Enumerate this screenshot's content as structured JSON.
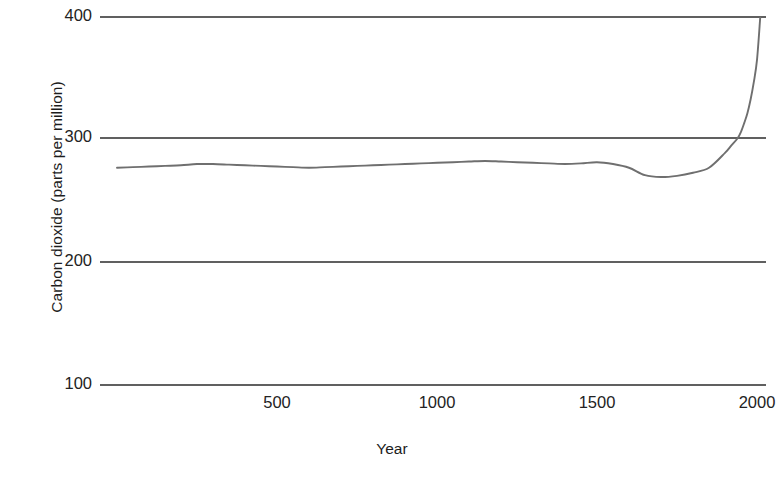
{
  "chart_data": {
    "type": "line",
    "title": "",
    "subtitle": "",
    "xlabel": "Year",
    "ylabel": "Carbon dioxide (parts per million)",
    "xlim": [
      0,
      2010
    ],
    "ylim": [
      100,
      400
    ],
    "xticks": [
      500,
      1000,
      1500,
      2000
    ],
    "xtick_labels": [
      "500",
      "1000",
      "1500",
      "2000"
    ],
    "yticks": [
      100,
      200,
      300,
      400
    ],
    "ytick_labels": [
      "100",
      "200",
      "300",
      "400"
    ],
    "grid": "horizontal",
    "legend": "none",
    "line_color": "#6f6f6f",
    "grid_color": "#2b2b2b",
    "series": [
      {
        "name": "Atmospheric CO2",
        "units": "parts per million",
        "x": [
          0,
          50,
          100,
          150,
          200,
          250,
          300,
          350,
          400,
          450,
          500,
          550,
          600,
          650,
          700,
          750,
          800,
          850,
          900,
          950,
          1000,
          1050,
          1100,
          1150,
          1200,
          1250,
          1300,
          1350,
          1400,
          1450,
          1500,
          1550,
          1600,
          1650,
          1700,
          1750,
          1800,
          1850,
          1900,
          1920,
          1940,
          1950,
          1960,
          1970,
          1980,
          1990,
          2000,
          2010
        ],
        "values": [
          276,
          276.5,
          277,
          277.5,
          278,
          279,
          279,
          278.5,
          278,
          277.5,
          277,
          276.5,
          276,
          276.5,
          277,
          277.5,
          278,
          278.5,
          279,
          279.5,
          280,
          280.5,
          281,
          281.5,
          281,
          280.5,
          280,
          279.5,
          279,
          279.5,
          280.5,
          279,
          276,
          270,
          268.5,
          269.5,
          272,
          276,
          288,
          294,
          300,
          305,
          312,
          320,
          331,
          345,
          363,
          397
        ]
      }
    ],
    "annotations": []
  }
}
